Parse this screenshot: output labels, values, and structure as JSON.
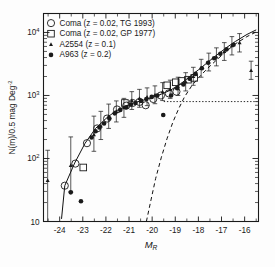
{
  "figure": {
    "background": "#fdfdfd",
    "foreground": "#1a1a1a"
  },
  "chart_data": {
    "type": "scatter",
    "title": "",
    "xlabel": "M_R",
    "xlabel_main": "M",
    "xlabel_sub": "R",
    "ylabel": "N(m)/0.5 mag Deg-2",
    "ylabel_main": "N(m)/0.5 mag Deg",
    "ylabel_sup": "-2",
    "xlim": [
      -24.7,
      -15.4
    ],
    "ylim": [
      10,
      20000
    ],
    "yscale": "log",
    "xscale": "linear",
    "grid": false,
    "xticks": [
      -24,
      -23,
      -22,
      -21,
      -20,
      -19,
      -18,
      -17,
      -16
    ],
    "xticklabels": [
      "-24",
      "-23",
      "-22",
      "-21",
      "-20",
      "-19",
      "-18",
      "-17",
      "-16"
    ],
    "yticks": [
      100,
      1000,
      10000
    ],
    "yticklabels_base": [
      "10",
      "10",
      "10"
    ],
    "yticklabels_exp": [
      "2",
      "3",
      "4"
    ],
    "ytick_bottom_label": "10",
    "legend_position": "upper-left",
    "series": [
      {
        "name": "Coma (z = 0.02, TG 1993)",
        "marker": "open-circle",
        "points": [
          {
            "x": -23.78,
            "y": 37
          },
          {
            "x": -23.32,
            "y": 83
          },
          {
            "x": -22.82,
            "y": 175
          },
          {
            "x": -22.38,
            "y": 300
          },
          {
            "x": -21.95,
            "y": 430
          },
          {
            "x": -21.52,
            "y": 600
          },
          {
            "x": -21.12,
            "y": 690
          },
          {
            "x": -20.85,
            "y": 760
          },
          {
            "x": -20.55,
            "y": 790
          },
          {
            "x": -20.28,
            "y": 700
          },
          {
            "x": -19.95,
            "y": 880
          },
          {
            "x": -19.62,
            "y": 1000
          },
          {
            "x": -19.28,
            "y": 1080
          },
          {
            "x": -18.95,
            "y": 1150
          }
        ]
      },
      {
        "name": "Coma (z = 0.02, GP 1977)",
        "marker": "open-square",
        "points": [
          {
            "x": -22.98,
            "y": 72
          },
          {
            "x": -21.18,
            "y": 760
          },
          {
            "x": -19.35,
            "y": 1450
          },
          {
            "x": -18.98,
            "y": 1620
          },
          {
            "x": -18.72,
            "y": 1700
          },
          {
            "x": -18.45,
            "y": 1780
          },
          {
            "x": -18.18,
            "y": 1900
          }
        ]
      },
      {
        "name": "A2554 (z = 0.1)",
        "marker": "small-triangle",
        "points": [
          {
            "x": -24.52,
            "y": 45,
            "err_lo": 10,
            "err_hi": 135
          },
          {
            "x": -23.52,
            "y": 78,
            "err_lo": 30,
            "err_hi": 220
          },
          {
            "x": -22.52,
            "y": 240,
            "err_lo": 130,
            "err_hi": 470
          },
          {
            "x": -22.22,
            "y": 330,
            "err_lo": 200,
            "err_hi": 560
          },
          {
            "x": -21.88,
            "y": 470,
            "err_lo": 300,
            "err_hi": 730
          },
          {
            "x": -21.55,
            "y": 560,
            "err_lo": 380,
            "err_hi": 820
          },
          {
            "x": -21.22,
            "y": 640,
            "err_lo": 450,
            "err_hi": 900
          },
          {
            "x": -20.88,
            "y": 830,
            "err_lo": 600,
            "err_hi": 1150
          },
          {
            "x": -20.55,
            "y": 900,
            "err_lo": 650,
            "err_hi": 1250
          },
          {
            "x": -20.22,
            "y": 950,
            "err_lo": 690,
            "err_hi": 1320
          },
          {
            "x": -19.88,
            "y": 1020,
            "err_lo": 740,
            "err_hi": 1420
          },
          {
            "x": -19.55,
            "y": 1150,
            "err_lo": 830,
            "err_hi": 1600
          },
          {
            "x": -19.22,
            "y": 1250,
            "err_lo": 900,
            "err_hi": 1750
          },
          {
            "x": -18.88,
            "y": 1400,
            "err_lo": 1000,
            "err_hi": 1950
          },
          {
            "x": -18.55,
            "y": 1650,
            "err_lo": 1180,
            "err_hi": 2300
          },
          {
            "x": -18.22,
            "y": 2000,
            "err_lo": 1450,
            "err_hi": 2800
          },
          {
            "x": -17.88,
            "y": 2700,
            "err_lo": 1950,
            "err_hi": 3750
          },
          {
            "x": -17.55,
            "y": 3400,
            "err_lo": 2450,
            "err_hi": 4700
          },
          {
            "x": -17.22,
            "y": 4100,
            "err_lo": 2950,
            "err_hi": 5700
          },
          {
            "x": -16.88,
            "y": 5000,
            "err_lo": 3600,
            "err_hi": 6900
          },
          {
            "x": -16.55,
            "y": 6200,
            "err_lo": 4400,
            "err_hi": 8600
          },
          {
            "x": -16.22,
            "y": 6900,
            "err_lo": 4900,
            "err_hi": 9600
          },
          {
            "x": -15.72,
            "y": 2500,
            "err_lo": 1800,
            "err_hi": 3500
          }
        ]
      },
      {
        "name": "A963 (z = 0.2)",
        "marker": "filled-circle",
        "points": [
          {
            "x": -23.52,
            "y": 29
          },
          {
            "x": -23.08,
            "y": 21
          },
          {
            "x": -22.62,
            "y": 215
          },
          {
            "x": -22.45,
            "y": 270
          },
          {
            "x": -22.28,
            "y": 310
          },
          {
            "x": -22.08,
            "y": 360
          },
          {
            "x": -21.85,
            "y": 430
          },
          {
            "x": -21.62,
            "y": 520
          },
          {
            "x": -21.38,
            "y": 590
          },
          {
            "x": -21.12,
            "y": 650
          },
          {
            "x": -20.92,
            "y": 720
          },
          {
            "x": -20.72,
            "y": 760
          },
          {
            "x": -20.48,
            "y": 820
          },
          {
            "x": -20.25,
            "y": 880
          },
          {
            "x": -20.02,
            "y": 950
          },
          {
            "x": -19.78,
            "y": 1000
          },
          {
            "x": -19.52,
            "y": 490
          },
          {
            "x": -19.18,
            "y": 1000
          },
          {
            "x": -18.92,
            "y": 1300
          },
          {
            "x": -18.65,
            "y": 1500
          },
          {
            "x": -18.38,
            "y": 1850
          },
          {
            "x": -18.12,
            "y": 2200
          },
          {
            "x": -17.85,
            "y": 2700
          },
          {
            "x": -17.58,
            "y": 3300
          },
          {
            "x": -17.32,
            "y": 3900
          },
          {
            "x": -17.05,
            "y": 4600
          },
          {
            "x": -16.78,
            "y": 5400
          },
          {
            "x": -16.48,
            "y": 6400
          }
        ]
      }
    ],
    "curves": [
      {
        "name": "composite-fit",
        "style": "solid",
        "points": [
          {
            "x": -23.92,
            "y": 11
          },
          {
            "x": -23.78,
            "y": 37
          },
          {
            "x": -23.35,
            "y": 85
          },
          {
            "x": -22.9,
            "y": 175
          },
          {
            "x": -22.45,
            "y": 300
          },
          {
            "x": -22.0,
            "y": 430
          },
          {
            "x": -21.6,
            "y": 560
          },
          {
            "x": -21.2,
            "y": 660
          },
          {
            "x": -20.8,
            "y": 760
          },
          {
            "x": -20.4,
            "y": 840
          },
          {
            "x": -20.0,
            "y": 930
          },
          {
            "x": -19.6,
            "y": 1050
          },
          {
            "x": -19.2,
            "y": 1220
          },
          {
            "x": -18.8,
            "y": 1500
          },
          {
            "x": -18.4,
            "y": 1950
          },
          {
            "x": -18.0,
            "y": 2550
          },
          {
            "x": -17.6,
            "y": 3350
          },
          {
            "x": -17.2,
            "y": 4400
          },
          {
            "x": -16.8,
            "y": 5700
          },
          {
            "x": -16.4,
            "y": 7200
          },
          {
            "x": -15.9,
            "y": 9300
          },
          {
            "x": -15.5,
            "y": 11000
          }
        ]
      },
      {
        "name": "dwarf-population",
        "style": "dashed",
        "points": [
          {
            "x": -20.25,
            "y": 10
          },
          {
            "x": -20.05,
            "y": 22
          },
          {
            "x": -19.85,
            "y": 48
          },
          {
            "x": -19.6,
            "y": 105
          },
          {
            "x": -19.35,
            "y": 210
          },
          {
            "x": -19.1,
            "y": 380
          },
          {
            "x": -18.85,
            "y": 620
          },
          {
            "x": -18.6,
            "y": 950
          },
          {
            "x": -18.3,
            "y": 1400
          },
          {
            "x": -18.0,
            "y": 1900
          },
          {
            "x": -17.6,
            "y": 2700
          },
          {
            "x": -17.2,
            "y": 3700
          },
          {
            "x": -16.8,
            "y": 5000
          },
          {
            "x": -16.4,
            "y": 6600
          },
          {
            "x": -15.9,
            "y": 8600
          },
          {
            "x": -15.5,
            "y": 10200
          }
        ]
      },
      {
        "name": "giant-population-plateau",
        "style": "dotted",
        "points": [
          {
            "x": -19.5,
            "y": 800
          },
          {
            "x": -15.45,
            "y": 800
          }
        ]
      }
    ],
    "legend": [
      {
        "label": "Coma (z = 0.02, TG 1993)",
        "marker": "open-circle"
      },
      {
        "label": "Coma (z = 0.02, GP 1977)",
        "marker": "open-square"
      },
      {
        "label": "A2554 (z = 0.1)",
        "marker": "small-triangle"
      },
      {
        "label": "A963 (z = 0.2)",
        "marker": "filled-circle"
      }
    ]
  }
}
